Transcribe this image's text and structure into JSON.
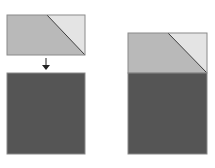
{
  "diagram": {
    "colors": {
      "background": "#ffffff",
      "trapezoid_fill": "#b9b9b9",
      "triangle_fill": "#e4e4e4",
      "square_fill": "#555555",
      "outline": "#8a8a8a",
      "diagonal": "#3a3a3a",
      "arrow": "#222222"
    },
    "panels": [
      {
        "name": "before",
        "shapes": [
          "split-rectangle",
          "down-arrow",
          "dark-square"
        ],
        "arrangement": "separated"
      },
      {
        "name": "after",
        "shapes": [
          "split-rectangle",
          "dark-square"
        ],
        "arrangement": "stacked"
      }
    ]
  }
}
